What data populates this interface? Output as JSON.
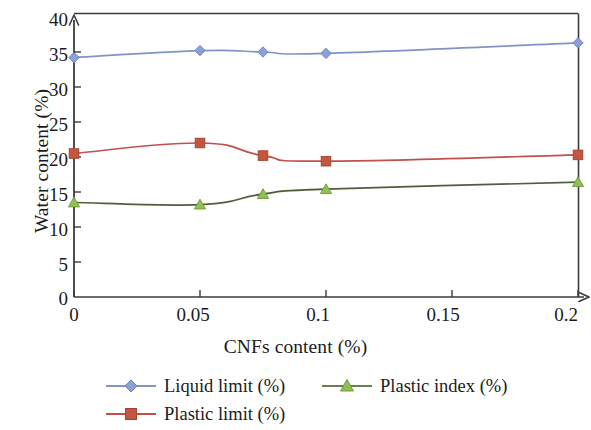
{
  "chart_data": {
    "type": "line",
    "title": "",
    "xlabel": "CNFs content (%)",
    "ylabel": "Water content (%)",
    "x": [
      0,
      0.05,
      0.075,
      0.1,
      0.2
    ],
    "xlim": [
      0,
      0.2
    ],
    "ylim": [
      0,
      40
    ],
    "xticks": [
      "0",
      "0.05",
      "0.1",
      "0.15",
      "0.2"
    ],
    "xtick_values": [
      0,
      0.05,
      0.1,
      0.15,
      0.2
    ],
    "yticks": [
      "0",
      "5",
      "10",
      "15",
      "20",
      "25",
      "30",
      "35",
      "40"
    ],
    "ytick_values": [
      0,
      5,
      10,
      15,
      20,
      25,
      30,
      35,
      40
    ],
    "grid": false,
    "legend_position": "bottom",
    "series": [
      {
        "name": "Liquid limit (%)",
        "color": "#8193c9",
        "marker": "diamond",
        "marker_color": "#8ba0d6",
        "values": [
          34.2,
          35.2,
          35.0,
          34.8,
          36.3
        ]
      },
      {
        "name": "Plastic limit (%)",
        "color": "#c0504d",
        "marker": "square",
        "marker_color": "#c4563f",
        "values": [
          20.5,
          22.0,
          20.2,
          19.4,
          20.3
        ]
      },
      {
        "name": "Plastic index (%)",
        "color": "#4f5f3a",
        "marker": "triangle",
        "marker_color": "#8fc055",
        "values": [
          13.5,
          13.2,
          14.7,
          15.4,
          16.4
        ]
      }
    ]
  },
  "axes": {
    "ylabel": "Water content (%)",
    "xlabel": "CNFs content (%)",
    "ytick_labels": [
      "40",
      "35",
      "30",
      "25",
      "20",
      "15",
      "10",
      "5",
      "0"
    ],
    "xtick_labels": [
      "0",
      "0.05",
      "0.1",
      "0.15",
      "0.2"
    ]
  },
  "legend": {
    "items": [
      {
        "label": "Liquid limit (%)",
        "color": "#8193c9",
        "marker": "diamond-marker"
      },
      {
        "label": "Plastic limit (%)",
        "color": "#c0504d",
        "marker": "square-marker"
      },
      {
        "label": "Plastic index (%)",
        "color": "#4f5f3a",
        "marker": "triangle-marker"
      }
    ]
  }
}
